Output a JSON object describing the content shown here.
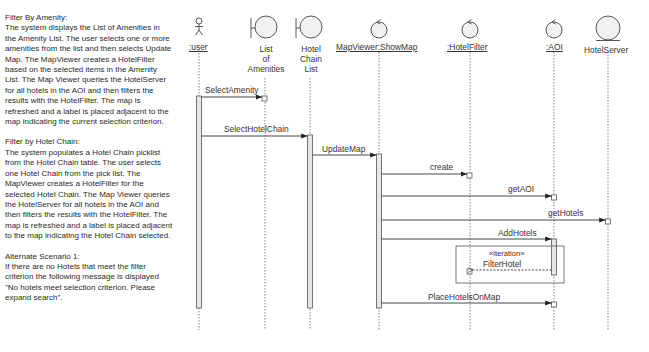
{
  "notes": {
    "sections": [
      {
        "title": "Filter By Amenity:",
        "body": "The system displays the List of Amenities in the Amenity List.  The user selects one or more amenities from the list and then selects Update Map.  The MapViewer creates a HotelFilter based on the selected items in the Amenity List.  The Map Viewer queries the HotelServer for all hotels in the AOI and then filters the results with the HotelFilter. The map is refreshed and a label is placed adjacent to the map indicating the current selection criterion."
      },
      {
        "title": "Filter by Hotel Chain:",
        "body": "The system populates a Hotel Chain picklist from the Hotel Chain table. The user selects one Hotel Chain from the pick list.   The MapViewer creates a HotelFilter for the selected Hotel Chain.  The Map Viewer queries the HotelServer for all hotels in the AOI and then filters the results with the HotelFilter.  The map is refreshed and a label is placed adjacent to the map indicating the Hotel Chain selected."
      },
      {
        "title": "Alternate Scenario 1:",
        "body": "If there are no Hotels that meet the filter criterion the following message is displayed \"No hotels meet selection criterion. Please expand search\"."
      }
    ]
  },
  "diagram": {
    "lifelines": [
      {
        "id": "user",
        "label": ":user",
        "type": "actor",
        "x": 199
      },
      {
        "id": "amenities",
        "label": "List of Amenities",
        "lines": [
          "List",
          "of",
          "Amenities"
        ],
        "type": "boundary",
        "x": 265
      },
      {
        "id": "chain",
        "label": "Hotel Chain List",
        "lines": [
          "Hotel",
          "Chain",
          "List"
        ],
        "type": "boundary",
        "x": 310
      },
      {
        "id": "mapviewer",
        "label": "MapViewer:ShowMap",
        "type": "control",
        "x": 379
      },
      {
        "id": "hotelfilter",
        "label": ":HotelFilter",
        "type": "control",
        "x": 470
      },
      {
        "id": "aoi",
        "label": ":AOI",
        "type": "control",
        "x": 554
      },
      {
        "id": "hotelserver",
        "label": "HotelServer",
        "type": "entity",
        "x": 608
      }
    ],
    "messages": [
      {
        "label": "SelectAmenity",
        "from": "user",
        "to": "amenities",
        "y": 97
      },
      {
        "label": "SelectHotelChain",
        "from": "user",
        "to": "chain",
        "y": 136
      },
      {
        "label": "UpdateMap",
        "from": "chain",
        "to": "mapviewer",
        "y": 155
      },
      {
        "label": "create",
        "from": "mapviewer",
        "to": "hotelfilter",
        "y": 174
      },
      {
        "label": "getAOI",
        "from": "mapviewer",
        "to": "aoi",
        "y": 196
      },
      {
        "label": "getHotels",
        "from": "mapviewer",
        "to": "hotelserver",
        "y": 220
      },
      {
        "label": "AddHotels",
        "from": "mapviewer",
        "to": "aoi",
        "y": 239
      },
      {
        "label": "FilterHotel",
        "from": "aoi",
        "to": "hotelfilter",
        "y": 270,
        "style": "dashed"
      },
      {
        "label": "PlaceHotelsOnMap",
        "from": "mapviewer",
        "to": "aoi",
        "y": 302
      }
    ],
    "fragment": {
      "label": "«iteration»"
    }
  }
}
